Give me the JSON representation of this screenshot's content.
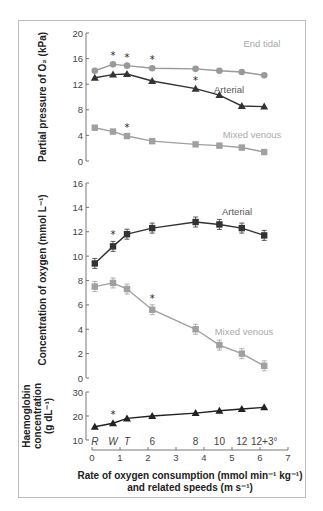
{
  "chart_data": [
    {
      "type": "line",
      "id": "partial-pressure",
      "ylabel": "Partial pressure of O₂ (kPa)",
      "ylim": [
        0,
        20
      ],
      "yticks": [
        0,
        4,
        8,
        12,
        16,
        20
      ],
      "x": [
        0.1,
        0.75,
        1.25,
        2.15,
        3.7,
        4.55,
        5.35,
        6.15
      ],
      "series": [
        {
          "name": "End tidal",
          "marker": "circle",
          "color": "#999999",
          "values": [
            14.1,
            15.1,
            14.9,
            14.5,
            14.4,
            14.1,
            13.9,
            13.4
          ],
          "significant": [
            false,
            true,
            true,
            true,
            false,
            false,
            false,
            false
          ]
        },
        {
          "name": "Arterial",
          "marker": "triangle",
          "color": "#333333",
          "values": [
            13.0,
            13.5,
            13.6,
            12.5,
            11.3,
            10.3,
            8.6,
            8.5
          ],
          "significant": [
            false,
            false,
            false,
            false,
            true,
            false,
            false,
            false
          ]
        },
        {
          "name": "Mixed venous",
          "marker": "square",
          "color": "#a0a0a0",
          "values": [
            5.2,
            4.6,
            3.9,
            3.1,
            2.6,
            2.4,
            2.1,
            1.4
          ],
          "significant": [
            false,
            false,
            true,
            false,
            false,
            false,
            false,
            false
          ]
        }
      ]
    },
    {
      "type": "line",
      "id": "oxygen-concentration",
      "ylabel": "Concentration of oxygen (mmol L⁻¹)",
      "ylim": [
        0,
        16
      ],
      "yticks": [
        0,
        2,
        4,
        6,
        8,
        10,
        12,
        14,
        16
      ],
      "x": [
        0.1,
        0.75,
        1.25,
        2.15,
        3.7,
        4.55,
        5.35,
        6.15
      ],
      "series": [
        {
          "name": "Arterial",
          "marker": "square",
          "color": "#333333",
          "values": [
            9.4,
            10.8,
            11.8,
            12.3,
            12.8,
            12.6,
            12.3,
            11.7
          ],
          "significant": [
            false,
            true,
            false,
            false,
            false,
            false,
            false,
            false
          ]
        },
        {
          "name": "Mixed venous",
          "marker": "square",
          "color": "#a0a0a0",
          "values": [
            7.5,
            7.8,
            7.3,
            5.6,
            4.0,
            2.7,
            2.0,
            1.0
          ],
          "significant": [
            false,
            false,
            false,
            true,
            false,
            false,
            false,
            false
          ]
        }
      ]
    },
    {
      "type": "line",
      "id": "haemoglobin",
      "ylabel": [
        "Haemoglobin",
        "concentration",
        "(g dL⁻¹)"
      ],
      "ylim": [
        10,
        30
      ],
      "yticks": [
        10,
        20,
        30
      ],
      "x": [
        0.1,
        0.75,
        1.25,
        2.15,
        3.7,
        4.55,
        5.35,
        6.15
      ],
      "series": [
        {
          "name": "Haemoglobin",
          "marker": "triangle",
          "color": "#222222",
          "values": [
            15.5,
            17.0,
            19.0,
            20.0,
            21.2,
            22.2,
            22.9,
            23.6
          ],
          "significant": [
            false,
            true,
            false,
            false,
            false,
            false,
            false,
            false
          ]
        }
      ]
    }
  ],
  "x_axis": {
    "xlim": [
      0,
      7
    ],
    "xticks": [
      0,
      1,
      2,
      3,
      4,
      5,
      6,
      7
    ],
    "xlabel_line1": "Rate of oxygen consumption (mmol min⁻¹ kg⁻¹)",
    "xlabel_line2": "and related speeds (m s⁻¹)",
    "speed_labels": [
      {
        "text": "R",
        "italic": true,
        "x": 0.1
      },
      {
        "text": "W",
        "italic": true,
        "x": 0.75
      },
      {
        "text": "T",
        "italic": true,
        "x": 1.25
      },
      {
        "text": "6",
        "italic": false,
        "x": 2.15
      },
      {
        "text": "8",
        "italic": false,
        "x": 3.7
      },
      {
        "text": "10",
        "italic": false,
        "x": 4.55
      },
      {
        "text": "12",
        "italic": false,
        "x": 5.35
      },
      {
        "text": "12+3°",
        "italic": false,
        "x": 6.15
      }
    ]
  },
  "significance_marker": "*"
}
